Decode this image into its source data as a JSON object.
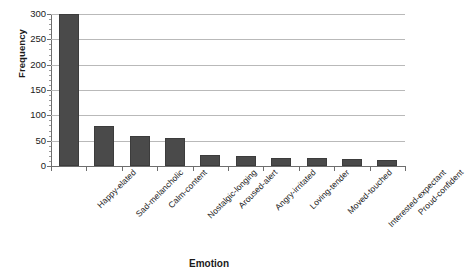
{
  "chart_data": {
    "type": "bar",
    "title": "",
    "xlabel": "Emotion",
    "ylabel": "Frequency",
    "categories": [
      "Happy-elated",
      "Sad-melancholic",
      "Calm-content",
      "Nostalgic-longing",
      "Aroused-alert",
      "Angry-irritated",
      "Loving-tender",
      "Moved-touched",
      "Interested-expectant",
      "Proud-confident"
    ],
    "values": [
      300,
      78,
      60,
      56,
      22,
      20,
      16,
      15,
      13,
      11
    ],
    "ylim": [
      0,
      300
    ],
    "yticks": [
      0,
      50,
      100,
      150,
      200,
      250,
      300
    ],
    "ytick_labels": [
      "0",
      "50",
      "100",
      "150",
      "200",
      "250",
      "300"
    ],
    "minor_tick_step": 10,
    "grid": true,
    "grid_axis": "y",
    "legend": false,
    "bar_color": "#4a4a4a",
    "grid_color": "#b9b9b9",
    "axis_color": "#6e6e6e"
  }
}
